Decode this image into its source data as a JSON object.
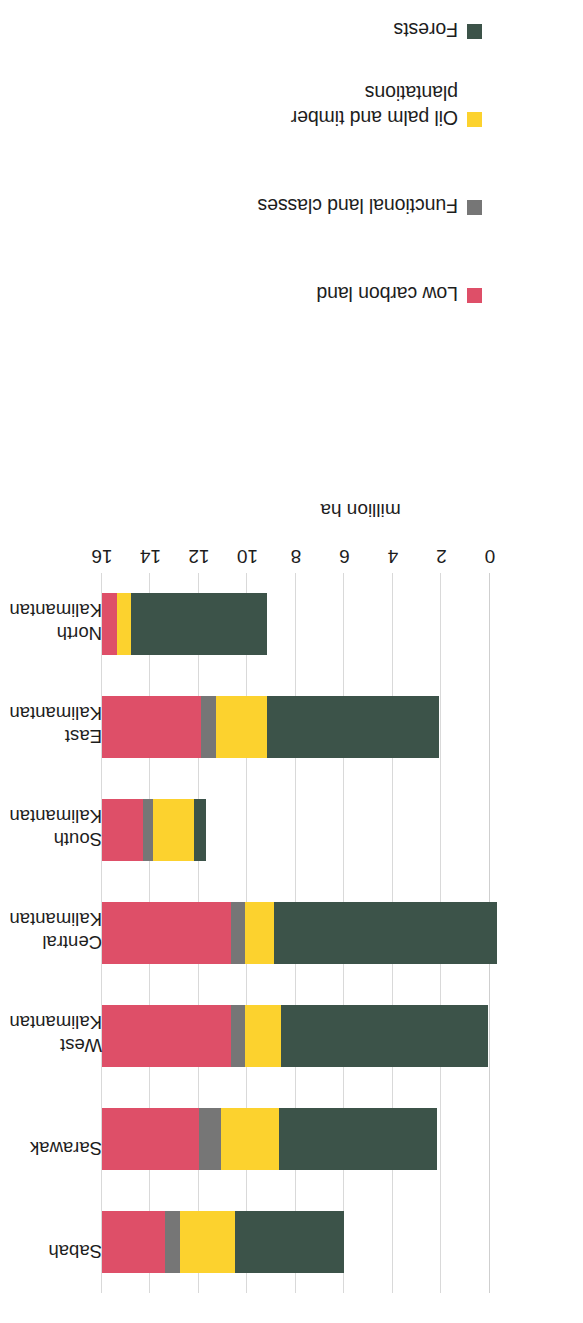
{
  "chart_data": {
    "type": "bar",
    "orientation": "horizontal",
    "stacked": true,
    "title": "",
    "subtitle": "",
    "xlabel": "million ha",
    "ylabel": "",
    "categories": [
      "Sabah",
      "Sarawak",
      "West Kalimantan",
      "Central Kalimantan",
      "South Kalimantan",
      "East Kalimantan",
      "North Kalimantan"
    ],
    "category_lines": [
      [
        "Sabah",
        ""
      ],
      [
        "Sarawak",
        ""
      ],
      [
        "West",
        "Kalimantan"
      ],
      [
        "Central",
        "Kalimantan"
      ],
      [
        "South",
        "Kalimantan"
      ],
      [
        "East",
        "Kalimantan"
      ],
      [
        "North",
        "Kalimantan"
      ]
    ],
    "series": [
      {
        "name": "Low carbon land",
        "color": "#DE4F68",
        "values": [
          2.6,
          4.0,
          5.3,
          5.3,
          1.7,
          4.1,
          0.6
        ]
      },
      {
        "name": "Functional land classes",
        "color": "#767676",
        "values": [
          0.6,
          0.9,
          0.6,
          0.6,
          0.4,
          0.6,
          0.0
        ]
      },
      {
        "name": "Oil palm and timber plantations",
        "color": "#FCD22E",
        "values": [
          2.3,
          2.4,
          1.5,
          1.2,
          1.7,
          2.1,
          0.6
        ]
      },
      {
        "name": "Forests",
        "color": "#3C5349",
        "values": [
          4.5,
          6.5,
          8.5,
          9.2,
          0.5,
          7.1,
          5.6
        ]
      }
    ],
    "totals": [
      10.0,
      13.8,
      15.9,
      16.3,
      4.3,
      13.9,
      6.8
    ],
    "xlim": [
      0,
      16
    ],
    "xticks": [
      0,
      2,
      4,
      6,
      8,
      10,
      12,
      14,
      16
    ],
    "xticklabels": [
      "0",
      "2",
      "4",
      "6",
      "8",
      "10",
      "12",
      "14",
      "16"
    ],
    "grid": "vertical",
    "legend_position": "right"
  },
  "legend": {
    "items": [
      {
        "label": "Low carbon land",
        "color": "#DE4F68"
      },
      {
        "label": "Functional land classes",
        "color": "#767676"
      },
      {
        "label": "Oil palm and timber\nplantations",
        "color": "#FCD22E"
      },
      {
        "label": "Forests",
        "color": "#3C5349"
      }
    ]
  },
  "axis": {
    "value_title": "million ha",
    "ticks": [
      "0",
      "2",
      "4",
      "6",
      "8",
      "10",
      "12",
      "14",
      "16"
    ]
  },
  "categories": {
    "items": [
      {
        "line1": "Sabah",
        "line2": ""
      },
      {
        "line1": "Sarawak",
        "line2": ""
      },
      {
        "line1": "West",
        "line2": "Kalimantan"
      },
      {
        "line1": "Central",
        "line2": "Kalimantan"
      },
      {
        "line1": "South",
        "line2": "Kalimantan"
      },
      {
        "line1": "East",
        "line2": "Kalimantan"
      },
      {
        "line1": "North",
        "line2": "Kalimantan"
      }
    ]
  },
  "colors": {
    "low_carbon_land": "#DE4F68",
    "functional_land_classes": "#767676",
    "oil_palm_and_timber_plantations": "#FCD22E",
    "forests": "#3C5349",
    "gridline": "#d9d9d9",
    "text": "#1d1d1d",
    "background": "#ffffff"
  }
}
